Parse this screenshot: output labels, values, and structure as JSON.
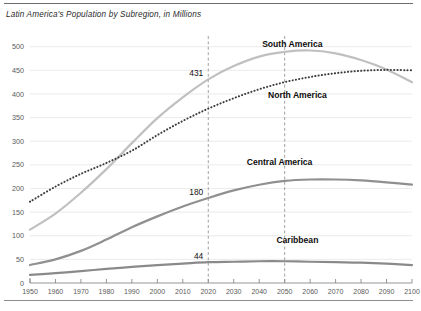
{
  "chart_data": {
    "type": "line",
    "title": "Latin America's Population by Subregion, in Millions",
    "xlabel": "",
    "ylabel": "",
    "xlim": [
      1950,
      2100
    ],
    "ylim": [
      0,
      510
    ],
    "yticks": [
      0,
      50,
      100,
      150,
      200,
      250,
      300,
      350,
      400,
      450,
      500
    ],
    "xticks": [
      1950,
      1960,
      1970,
      1980,
      1990,
      2000,
      2010,
      2020,
      2030,
      2040,
      2050,
      2060,
      2070,
      2080,
      2090,
      2100
    ],
    "grid": true,
    "legend_position": "inline-labels",
    "x": [
      1950,
      1960,
      1970,
      1980,
      1990,
      2000,
      2010,
      2020,
      2030,
      2040,
      2050,
      2060,
      2070,
      2080,
      2090,
      2100
    ],
    "series": [
      {
        "name": "South America",
        "color": "#c0c0c0",
        "style": "solid",
        "values": [
          113,
          147,
          191,
          241,
          296,
          349,
          393,
          431,
          459,
          479,
          489,
          492,
          486,
          472,
          452,
          425
        ]
      },
      {
        "name": "North America",
        "color": "#3d3d3d",
        "style": "dotted",
        "values": [
          172,
          204,
          231,
          254,
          280,
          313,
          343,
          369,
          391,
          410,
          425,
          436,
          444,
          449,
          451,
          450
        ]
      },
      {
        "name": "Central America",
        "color": "#909090",
        "style": "solid",
        "values": [
          38,
          50,
          68,
          92,
          118,
          141,
          162,
          180,
          196,
          208,
          216,
          219,
          219,
          217,
          213,
          208
        ]
      },
      {
        "name": "Caribbean",
        "color": "#8a8a8a",
        "style": "solid",
        "values": [
          17,
          21,
          25,
          30,
          34,
          38,
          41,
          44,
          45,
          46,
          46,
          45,
          44,
          43,
          41,
          38
        ]
      }
    ],
    "annotations": [
      {
        "label": "431",
        "x": 2020,
        "y": 431,
        "series": "South America"
      },
      {
        "label": "180",
        "x": 2020,
        "y": 180,
        "series": "Central America"
      },
      {
        "label": "44",
        "x": 2020,
        "y": 44,
        "series": "Caribbean"
      }
    ],
    "reference_lines": [
      {
        "x": 2020,
        "style": "dashed",
        "color": "#8a8a8a"
      },
      {
        "x": 2050,
        "style": "dashed",
        "color": "#8a8a8a"
      }
    ],
    "series_label_positions": [
      {
        "name": "South America",
        "x": 2053,
        "y": 500
      },
      {
        "name": "North America",
        "x": 2055,
        "y": 392
      },
      {
        "name": "Central America",
        "x": 2048,
        "y": 250
      },
      {
        "name": "Caribbean",
        "x": 2055,
        "y": 85
      }
    ]
  }
}
